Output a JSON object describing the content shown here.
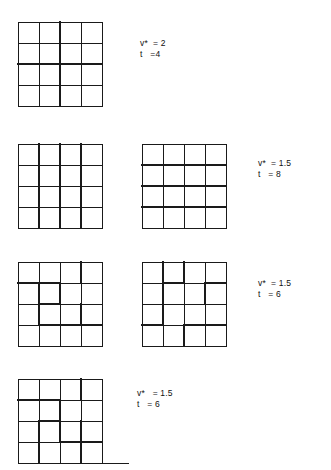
{
  "figure": {
    "background_color": "#ffffff",
    "line_color": "#1a1a1a",
    "thin_width": 1,
    "thick_width": 2.6,
    "grid_divisions": 4
  },
  "rows": [
    {
      "id": "row-1",
      "top": 18,
      "grids": [
        {
          "id": "grid-1a",
          "left": 18,
          "size": 84,
          "thick_vertical_lines": [
            2
          ],
          "thick_horizontal_lines": [
            2
          ],
          "thick_segments": [],
          "baseline_extension": 0
        }
      ],
      "annotation": {
        "left": 140,
        "top": 38,
        "line1": "v*  = 2",
        "line2": "t   =4",
        "v_star": 2,
        "t": 4
      }
    },
    {
      "id": "row-2",
      "top": 140,
      "grids": [
        {
          "id": "grid-2a",
          "left": 18,
          "size": 84,
          "thick_vertical_lines": [
            1,
            2,
            3
          ],
          "thick_horizontal_lines": [],
          "thick_segments": [],
          "baseline_extension": 0
        },
        {
          "id": "grid-2b",
          "left": 142,
          "size": 84,
          "thick_vertical_lines": [],
          "thick_horizontal_lines": [
            1,
            2,
            3
          ],
          "thick_segments": [],
          "baseline_extension": 0
        }
      ],
      "annotation": {
        "left": 258,
        "top": 158,
        "line1": "v*  = 1.5",
        "line2": "t   = 8",
        "v_star": 1.5,
        "t": 8
      }
    },
    {
      "id": "row-3",
      "top": 258,
      "grids": [
        {
          "id": "grid-3a",
          "left": 18,
          "size": 84,
          "thick_vertical_lines": [],
          "thick_horizontal_lines": [],
          "thick_segments": [
            {
              "type": "v",
              "col": 3,
              "from": 0,
              "to": 1
            },
            {
              "type": "h",
              "row": 1,
              "from": 0,
              "to": 2
            },
            {
              "type": "v",
              "col": 1,
              "from": 1,
              "to": 3
            },
            {
              "type": "v",
              "col": 2,
              "from": 1,
              "to": 2
            },
            {
              "type": "h",
              "row": 2,
              "from": 1,
              "to": 2
            },
            {
              "type": "v",
              "col": 3,
              "from": 2,
              "to": 3
            },
            {
              "type": "h",
              "row": 3,
              "from": 1,
              "to": 4
            }
          ],
          "baseline_extension": 0
        },
        {
          "id": "grid-3b",
          "left": 142,
          "size": 84,
          "thick_vertical_lines": [],
          "thick_horizontal_lines": [],
          "thick_segments": [
            {
              "type": "v",
              "col": 1,
              "from": 0,
              "to": 1
            },
            {
              "type": "v",
              "col": 2,
              "from": 0,
              "to": 1
            },
            {
              "type": "h",
              "row": 1,
              "from": 1,
              "to": 2
            },
            {
              "type": "h",
              "row": 1,
              "from": 3,
              "to": 4
            },
            {
              "type": "v",
              "col": 3,
              "from": 1,
              "to": 2
            },
            {
              "type": "v",
              "col": 1,
              "from": 1,
              "to": 3
            },
            {
              "type": "h",
              "row": 3,
              "from": 0,
              "to": 1
            },
            {
              "type": "h",
              "row": 3,
              "from": 2,
              "to": 4
            },
            {
              "type": "v",
              "col": 2,
              "from": 3,
              "to": 4
            }
          ],
          "baseline_extension": 0
        }
      ],
      "annotation": {
        "left": 258,
        "top": 278,
        "line1": "v*  = 1.5",
        "line2": "t   = 6",
        "v_star": 1.5,
        "t": 6
      }
    },
    {
      "id": "row-4",
      "top": 375,
      "grids": [
        {
          "id": "grid-4a",
          "left": 18,
          "size": 84,
          "thick_vertical_lines": [],
          "thick_horizontal_lines": [],
          "thick_segments": [
            {
              "type": "v",
              "col": 3,
              "from": 0,
              "to": 1
            },
            {
              "type": "h",
              "row": 1,
              "from": 0,
              "to": 2
            },
            {
              "type": "v",
              "col": 2,
              "from": 1,
              "to": 3
            },
            {
              "type": "h",
              "row": 2,
              "from": 1,
              "to": 2
            },
            {
              "type": "v",
              "col": 1,
              "from": 2,
              "to": 4
            },
            {
              "type": "h",
              "row": 3,
              "from": 2,
              "to": 4
            },
            {
              "type": "v",
              "col": 3,
              "from": 2,
              "to": 4
            }
          ],
          "baseline_extension": 26
        }
      ],
      "annotation": {
        "left": 137,
        "top": 388,
        "line1": "v*   = 1.5",
        "line2": "t   = 6",
        "v_star": 1.5,
        "t": 6
      }
    }
  ]
}
